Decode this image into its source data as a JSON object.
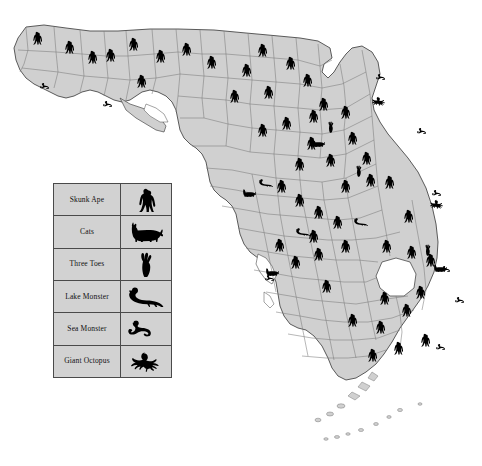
{
  "map": {
    "title": "Florida Cryptid Sightings Map",
    "state": "Florida",
    "fill_color": "#d0d0d0",
    "border_color": "#4a4a4a",
    "county_border_color": "#7a7a7a",
    "background_color": "#ffffff",
    "icon_color": "#000000",
    "lake_label": "Lake Okeechobee",
    "lake_fill": "#ffffff"
  },
  "legend": {
    "background_color": "#d2d2d2",
    "border_color": "#4a4a4a",
    "rows": [
      {
        "label": "Skunk Ape",
        "icon": "skunk-ape-icon"
      },
      {
        "label": "Cats",
        "icon": "cat-icon"
      },
      {
        "label": "Three Toes",
        "icon": "three-toes-icon"
      },
      {
        "label": "Lake Monster",
        "icon": "lake-monster-icon"
      },
      {
        "label": "Sea Monster",
        "icon": "sea-monster-icon"
      },
      {
        "label": "Giant Octopus",
        "icon": "giant-octopus-icon"
      }
    ]
  },
  "markers": {
    "skunk_ape": [
      {
        "x": 37,
        "y": 38
      },
      {
        "x": 69,
        "y": 47
      },
      {
        "x": 92,
        "y": 57
      },
      {
        "x": 110,
        "y": 55
      },
      {
        "x": 133,
        "y": 44
      },
      {
        "x": 160,
        "y": 56
      },
      {
        "x": 141,
        "y": 81
      },
      {
        "x": 186,
        "y": 49
      },
      {
        "x": 211,
        "y": 62
      },
      {
        "x": 246,
        "y": 70
      },
      {
        "x": 262,
        "y": 50
      },
      {
        "x": 290,
        "y": 63
      },
      {
        "x": 268,
        "y": 92
      },
      {
        "x": 234,
        "y": 96
      },
      {
        "x": 307,
        "y": 80
      },
      {
        "x": 323,
        "y": 104
      },
      {
        "x": 313,
        "y": 116
      },
      {
        "x": 345,
        "y": 112
      },
      {
        "x": 286,
        "y": 123
      },
      {
        "x": 262,
        "y": 130
      },
      {
        "x": 311,
        "y": 143
      },
      {
        "x": 352,
        "y": 138
      },
      {
        "x": 299,
        "y": 164
      },
      {
        "x": 330,
        "y": 160
      },
      {
        "x": 366,
        "y": 158
      },
      {
        "x": 281,
        "y": 186
      },
      {
        "x": 299,
        "y": 200
      },
      {
        "x": 345,
        "y": 186
      },
      {
        "x": 370,
        "y": 180
      },
      {
        "x": 389,
        "y": 182
      },
      {
        "x": 318,
        "y": 212
      },
      {
        "x": 337,
        "y": 222
      },
      {
        "x": 408,
        "y": 216
      },
      {
        "x": 313,
        "y": 236
      },
      {
        "x": 279,
        "y": 245
      },
      {
        "x": 295,
        "y": 262
      },
      {
        "x": 318,
        "y": 254
      },
      {
        "x": 345,
        "y": 246
      },
      {
        "x": 411,
        "y": 252
      },
      {
        "x": 430,
        "y": 260
      },
      {
        "x": 386,
        "y": 246
      },
      {
        "x": 420,
        "y": 292
      },
      {
        "x": 384,
        "y": 298
      },
      {
        "x": 326,
        "y": 286
      },
      {
        "x": 406,
        "y": 310
      },
      {
        "x": 380,
        "y": 327
      },
      {
        "x": 352,
        "y": 320
      },
      {
        "x": 398,
        "y": 348
      },
      {
        "x": 372,
        "y": 355
      },
      {
        "x": 425,
        "y": 340
      }
    ],
    "cats": [
      {
        "x": 249,
        "y": 193
      },
      {
        "x": 272,
        "y": 272
      },
      {
        "x": 318,
        "y": 143
      },
      {
        "x": 440,
        "y": 268
      }
    ],
    "three_toes": [
      {
        "x": 359,
        "y": 171
      },
      {
        "x": 428,
        "y": 250
      },
      {
        "x": 331,
        "y": 127
      }
    ],
    "lake_monster": [
      {
        "x": 303,
        "y": 232
      },
      {
        "x": 361,
        "y": 222
      },
      {
        "x": 266,
        "y": 183
      }
    ],
    "sea_monster": [
      {
        "x": 47,
        "y": 86
      },
      {
        "x": 110,
        "y": 104
      },
      {
        "x": 383,
        "y": 77
      },
      {
        "x": 272,
        "y": 278
      },
      {
        "x": 439,
        "y": 193
      },
      {
        "x": 424,
        "y": 131
      },
      {
        "x": 448,
        "y": 269
      },
      {
        "x": 443,
        "y": 347
      },
      {
        "x": 462,
        "y": 300
      }
    ],
    "giant_octopus": [
      {
        "x": 379,
        "y": 101
      },
      {
        "x": 437,
        "y": 204
      }
    ]
  }
}
